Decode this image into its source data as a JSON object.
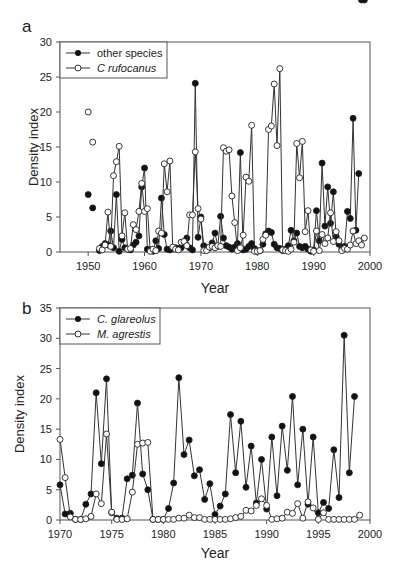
{
  "chart_data": [
    {
      "panel": "a",
      "type": "line",
      "title": "",
      "xlabel": "Year",
      "ylabel": "Density index",
      "xlim": [
        1945,
        2000
      ],
      "ylim": [
        0,
        30
      ],
      "xticks": [
        1950,
        1960,
        1970,
        1980,
        1990,
        2000
      ],
      "yticks": [
        0,
        5,
        10,
        15,
        20,
        25,
        30
      ],
      "legend_position": "upper left",
      "grid": false,
      "series": [
        {
          "name": "other species",
          "marker": "filled-circle",
          "points": [
            [
              1950,
              8.2
            ],
            [
              1950.8,
              6.3
            ]
          ],
          "x": [
            1952,
            1952.5,
            1953,
            1953.5,
            1954,
            1954.5,
            1955,
            1955.5,
            1956,
            1956.5,
            1957,
            1957.5,
            1958,
            1958.5,
            1959,
            1959.5,
            1960,
            1960.5,
            1961,
            1961.5,
            1962,
            1962.5,
            1963,
            1963.5,
            1964,
            1964.5,
            1965,
            1965.5,
            1966,
            1966.5,
            1967,
            1967.5,
            1968,
            1968.5,
            1969,
            1969.5,
            1970,
            1970.5,
            1971,
            1971.5,
            1972,
            1972.5,
            1973,
            1973.5,
            1974,
            1974.5,
            1975,
            1975.5,
            1976,
            1976.5,
            1977,
            1977.5,
            1978,
            1978.5,
            1979,
            1979.5,
            1980,
            1980.5,
            1981,
            1981.5,
            1982,
            1982.5,
            1983,
            1983.5,
            1984,
            1984.5,
            1985,
            1985.5,
            1986,
            1986.5,
            1987,
            1987.5,
            1988,
            1988.5,
            1989,
            1989.5,
            1990,
            1990.5,
            1991,
            1991.5,
            1992,
            1992.5,
            1993,
            1993.5,
            1994,
            1994.5,
            1995,
            1995.5,
            1996,
            1996.5,
            1997,
            1997.5,
            1998,
            1998.5,
            1999
          ],
          "values": [
            0.2,
            0.8,
            1.2,
            1.0,
            3.0,
            0.6,
            8.2,
            0.1,
            1.8,
            0.6,
            0.4,
            0.3,
            1.0,
            1.4,
            2.3,
            9.3,
            12.0,
            0.4,
            0.3,
            0.1,
            1.6,
            0.5,
            7.7,
            2.5,
            0.4,
            0.3,
            0.5,
            0.6,
            0.5,
            0.6,
            1.2,
            2.0,
            0.6,
            0.3,
            24.1,
            2.1,
            5.0,
            0.9,
            0.6,
            0.6,
            1.3,
            2.7,
            0.8,
            5.1,
            2.0,
            0.9,
            0.7,
            0.4,
            0.7,
            1.2,
            14.2,
            0.3,
            0.4,
            0.8,
            1.2,
            0.5,
            0.1,
            0.2,
            1.1,
            2.6,
            3.0,
            2.8,
            1.1,
            0.6,
            0.5,
            0.2,
            0.4,
            0.9,
            3.1,
            1.6,
            2.7,
            0.8,
            0.6,
            0.8,
            0.4,
            0.1,
            0.3,
            5.9,
            1.6,
            12.7,
            3.7,
            9.3,
            4.1,
            8.6,
            2.2,
            1.1,
            0.4,
            0.8,
            5.8,
            4.8,
            19.1,
            3.1,
            11.2
          ]
        },
        {
          "name": "C rufocanus",
          "marker": "open-circle",
          "points": [
            [
              1950,
              20.0
            ],
            [
              1950.8,
              15.7
            ]
          ],
          "x": [
            1952,
            1952.5,
            1953,
            1953.5,
            1954,
            1954.5,
            1955,
            1955.5,
            1956,
            1956.5,
            1957,
            1957.5,
            1958,
            1958.5,
            1959,
            1959.5,
            1960,
            1960.5,
            1961,
            1961.5,
            1962,
            1962.5,
            1963,
            1963.5,
            1964,
            1964.5,
            1965,
            1965.5,
            1966,
            1966.5,
            1967,
            1967.5,
            1968,
            1968.5,
            1969,
            1969.5,
            1970,
            1970.5,
            1971,
            1971.5,
            1972,
            1972.5,
            1973,
            1973.5,
            1974,
            1974.5,
            1975,
            1975.5,
            1976,
            1976.5,
            1977,
            1977.5,
            1978,
            1978.5,
            1979,
            1979.5,
            1980,
            1980.5,
            1981,
            1981.5,
            1982,
            1982.5,
            1983,
            1983.5,
            1984,
            1984.5,
            1985,
            1985.5,
            1986,
            1986.5,
            1987,
            1987.5,
            1988,
            1988.5,
            1989,
            1989.5,
            1990,
            1990.5,
            1991,
            1991.5,
            1992,
            1992.5,
            1993,
            1993.5,
            1994,
            1994.5,
            1995,
            1995.5,
            1996,
            1996.5,
            1997,
            1997.5,
            1998,
            1998.5,
            1999
          ],
          "values": [
            0.5,
            0.3,
            1.0,
            5.7,
            0.8,
            10.9,
            12.9,
            15.1,
            2.3,
            5.6,
            0.4,
            0.5,
            3.9,
            3.2,
            5.8,
            9.8,
            5.8,
            6.2,
            0.1,
            0.4,
            0.2,
            3.0,
            2.7,
            12.6,
            8.6,
            13.0,
            0.7,
            0.4,
            0.3,
            1.4,
            1.5,
            0.9,
            5.3,
            5.3,
            14.3,
            6.2,
            4.7,
            0.2,
            0.2,
            0.7,
            0.8,
            0.6,
            0.9,
            0.8,
            14.9,
            14.4,
            14.6,
            8.0,
            4.2,
            0.2,
            0.6,
            2.4,
            10.7,
            10.1,
            18.1,
            0.1,
            0.1,
            0.2,
            1.8,
            2.4,
            17.5,
            18.0,
            24.0,
            15.2,
            26.2,
            0.3,
            0.2,
            0.1,
            0.4,
            1.4,
            15.5,
            10.6,
            15.8,
            2.9,
            5.9,
            0.3,
            0.1,
            3.0,
            0.2,
            2.5,
            1.2,
            2.0,
            5.6,
            1.5,
            2.9,
            1.6,
            0.2,
            0.5,
            0.4,
            1.0,
            3.0,
            1.2,
            1.6,
            1.0,
            2.0
          ]
        }
      ]
    },
    {
      "panel": "b",
      "type": "line",
      "title": "",
      "xlabel": "Year",
      "ylabel": "Density index",
      "xlim": [
        1970,
        2000
      ],
      "ylim": [
        0,
        35
      ],
      "xticks": [
        1970,
        1975,
        1980,
        1985,
        1990,
        1995,
        2000
      ],
      "yticks": [
        0,
        5,
        10,
        15,
        20,
        25,
        30,
        35
      ],
      "legend_position": "upper left",
      "grid": false,
      "series": [
        {
          "name": "C. glareolus",
          "marker": "filled-circle",
          "x": [
            1970,
            1970.5,
            1971,
            1971.5,
            1972,
            1972.5,
            1973,
            1973.5,
            1974,
            1974.5,
            1975,
            1975.5,
            1976,
            1976.5,
            1977,
            1977.5,
            1978,
            1978.5,
            1979,
            1979.5,
            1980,
            1980.5,
            1981,
            1981.5,
            1982,
            1982.5,
            1983,
            1983.5,
            1984,
            1984.5,
            1985,
            1985.5,
            1986,
            1986.5,
            1987,
            1987.5,
            1988,
            1988.5,
            1989,
            1989.5,
            1990,
            1990.5,
            1991,
            1991.5,
            1992,
            1992.5,
            1993,
            1993.5,
            1994,
            1994.5,
            1995,
            1995.5,
            1996,
            1996.5,
            1997,
            1997.5,
            1998,
            1998.5
          ],
          "values": [
            5.8,
            1.0,
            1.1,
            0.1,
            0.1,
            2.6,
            4.3,
            21.0,
            9.3,
            23.3,
            1.2,
            0.3,
            0.3,
            6.8,
            7.4,
            19.3,
            7.6,
            5.0,
            0.1,
            0.1,
            0.1,
            1.9,
            6.1,
            23.5,
            10.8,
            13.2,
            7.3,
            8.3,
            3.4,
            6.0,
            0.9,
            2.3,
            4.3,
            17.4,
            7.8,
            16.3,
            5.4,
            12.2,
            2.8,
            10.0,
            1.8,
            13.7,
            4.0,
            15.5,
            8.2,
            20.4,
            5.8,
            15.0,
            2.6,
            13.7,
            1.2,
            2.9,
            1.9,
            11.6,
            3.7,
            30.5,
            7.8,
            20.4
          ]
        },
        {
          "name": "M. agrestis",
          "marker": "open-circle",
          "x": [
            1970,
            1970.5,
            1971,
            1971.5,
            1972,
            1972.5,
            1973,
            1973.5,
            1974,
            1974.5,
            1975,
            1975.5,
            1976,
            1976.5,
            1977,
            1977.5,
            1978,
            1978.5,
            1979,
            1979.5,
            1980,
            1980.5,
            1981,
            1981.5,
            1982,
            1982.5,
            1983,
            1983.5,
            1984,
            1984.5,
            1985,
            1985.5,
            1986,
            1986.5,
            1987,
            1987.5,
            1988,
            1988.5,
            1989,
            1989.5,
            1990,
            1990.5,
            1991,
            1991.5,
            1992,
            1992.5,
            1993,
            1993.5,
            1994,
            1994.5,
            1995,
            1995.5,
            1996,
            1996.5,
            1997,
            1997.5,
            1998,
            1998.5,
            1999
          ],
          "values": [
            13.3,
            7.0,
            0.5,
            0.1,
            0.1,
            0.2,
            0.6,
            4.3,
            2.7,
            14.2,
            1.3,
            0.1,
            0.1,
            0.2,
            4.6,
            12.5,
            12.7,
            12.8,
            0.1,
            0.1,
            0.1,
            0.1,
            0.1,
            0.3,
            0.3,
            0.8,
            0.4,
            0.4,
            0.1,
            0.1,
            0.1,
            0.1,
            0.1,
            0.2,
            0.4,
            0.6,
            1.6,
            1.5,
            2.4,
            3.5,
            2.4,
            0.1,
            0.2,
            0.3,
            1.3,
            1.1,
            2.7,
            0.3,
            3.0,
            2.0,
            0.1,
            1.2,
            0.1,
            0.1,
            0.1,
            0.1,
            0.1,
            0.1,
            0.8
          ]
        }
      ]
    }
  ],
  "panels": {
    "a": {
      "label": "a",
      "xlabel": "Year",
      "ylabel": "Density index",
      "legend": [
        "other species",
        "C  rufocanus"
      ]
    },
    "b": {
      "label": "b",
      "xlabel": "Year",
      "ylabel": "Density index",
      "legend": [
        "C. glareolus",
        "M. agrestis"
      ]
    }
  }
}
